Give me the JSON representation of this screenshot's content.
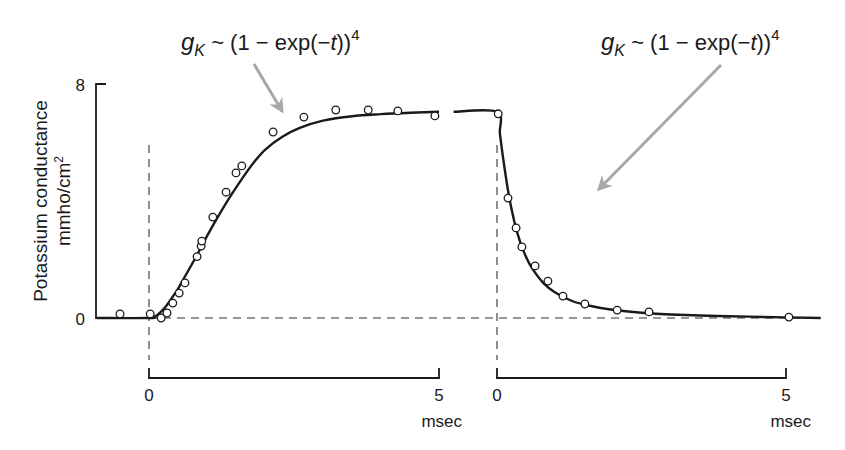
{
  "chart_data": {
    "type": "line",
    "title": "",
    "ylabel": "Potassium conductance",
    "ylabel_units": "mmho/cm²",
    "ylim": [
      0,
      8
    ],
    "y_ticks": [
      "0",
      "8"
    ],
    "grid": false,
    "legend": null,
    "annotations": [
      {
        "text_base": "g",
        "text_sub": "K",
        "text_rest": " ~ (1 − exp(−",
        "text_it": "t",
        "text_close": "))",
        "text_sup": "4",
        "panel": "left",
        "arrow_to": "rising curve"
      },
      {
        "text_base": "g",
        "text_sub": "K",
        "text_rest": " ~ (1 − exp(−",
        "text_it": "t",
        "text_close": "))",
        "text_sup": "4",
        "panel": "right",
        "arrow_to": "falling curve"
      }
    ],
    "panels": [
      {
        "name": "rise (depolarization on)",
        "xlabel": "msec",
        "x_ticks": [
          "0",
          "5"
        ],
        "xlim": [
          -0.9,
          5.1
        ],
        "series": [
          {
            "name": "fit",
            "style": "line",
            "x": [
              -0.9,
              0,
              0.1,
              0.2,
              0.3,
              0.4,
              0.5,
              0.6,
              0.8,
              1.0,
              1.2,
              1.4,
              1.6,
              1.8,
              2.0,
              2.3,
              2.6,
              3.0,
              3.5,
              4.0,
              4.5,
              5.0
            ],
            "y": [
              0,
              0,
              0.05,
              0.2,
              0.42,
              0.7,
              1.0,
              1.35,
              2.05,
              2.8,
              3.5,
              4.15,
              4.75,
              5.3,
              5.75,
              6.2,
              6.5,
              6.75,
              6.9,
              6.97,
              7.02,
              7.05
            ]
          },
          {
            "name": "measured",
            "style": "open-circle",
            "x": [
              -0.5,
              0.02,
              0.21,
              0.31,
              0.41,
              0.52,
              0.62,
              0.83,
              0.9,
              0.91,
              1.1,
              1.33,
              1.5,
              1.6,
              2.14,
              2.67,
              3.22,
              3.78,
              4.29,
              4.93
            ],
            "y": [
              0.14,
              0.14,
              0.0,
              0.17,
              0.51,
              0.85,
              1.2,
              2.1,
              2.46,
              2.63,
              3.45,
              4.3,
              4.96,
              5.2,
              6.36,
              6.87,
              7.11,
              7.11,
              7.08,
              6.91
            ]
          }
        ]
      },
      {
        "name": "fall (repolarization)",
        "xlabel": "msec",
        "x_ticks": [
          "0",
          "5"
        ],
        "xlim": [
          -0.75,
          5.6
        ],
        "series": [
          {
            "name": "fit",
            "style": "line",
            "x": [
              -0.75,
              0,
              0.05,
              0.1,
              0.2,
              0.3,
              0.4,
              0.5,
              0.6,
              0.8,
              1.0,
              1.3,
              1.6,
              2.0,
              2.5,
              3.0,
              4.0,
              5.0,
              5.6
            ],
            "y": [
              7.05,
              7.05,
              6.3,
              5.55,
              4.25,
              3.3,
              2.6,
              2.1,
              1.72,
              1.2,
              0.88,
              0.58,
              0.42,
              0.28,
              0.18,
              0.12,
              0.06,
              0.02,
              0.0
            ]
          },
          {
            "name": "measured",
            "style": "open-circle",
            "x": [
              0.02,
              0.19,
              0.33,
              0.43,
              0.66,
              0.88,
              1.14,
              1.52,
              2.08,
              2.63,
              5.05
            ],
            "y": [
              6.98,
              4.1,
              3.08,
              2.43,
              1.78,
              1.26,
              0.75,
              0.48,
              0.27,
              0.21,
              0.03
            ]
          }
        ]
      }
    ]
  },
  "axes": {
    "y_label_line1": "Potassium conductance",
    "y_label_line2": "mmho/cm",
    "y_label_sup": "2",
    "y_tick_top": "8",
    "y_tick_bottom": "0",
    "left_x_tick_0": "0",
    "left_x_tick_5": "5",
    "left_x_unit": "msec",
    "right_x_tick_0": "0",
    "right_x_tick_5": "5",
    "right_x_unit": "msec"
  },
  "annotations": {
    "left": {
      "g": "g",
      "sub": "K",
      "rest": " ~ (1 − exp(−",
      "t": "t",
      "close": "))",
      "sup": "4"
    },
    "right": {
      "g": "g",
      "sub": "K",
      "rest": " ~ (1 − exp(−",
      "t": "t",
      "close": "))",
      "sup": "4"
    }
  },
  "colors": {
    "ink": "#1a1a1a",
    "arrow": "#a8a8a8",
    "dash": "#333333",
    "background": "#ffffff"
  }
}
